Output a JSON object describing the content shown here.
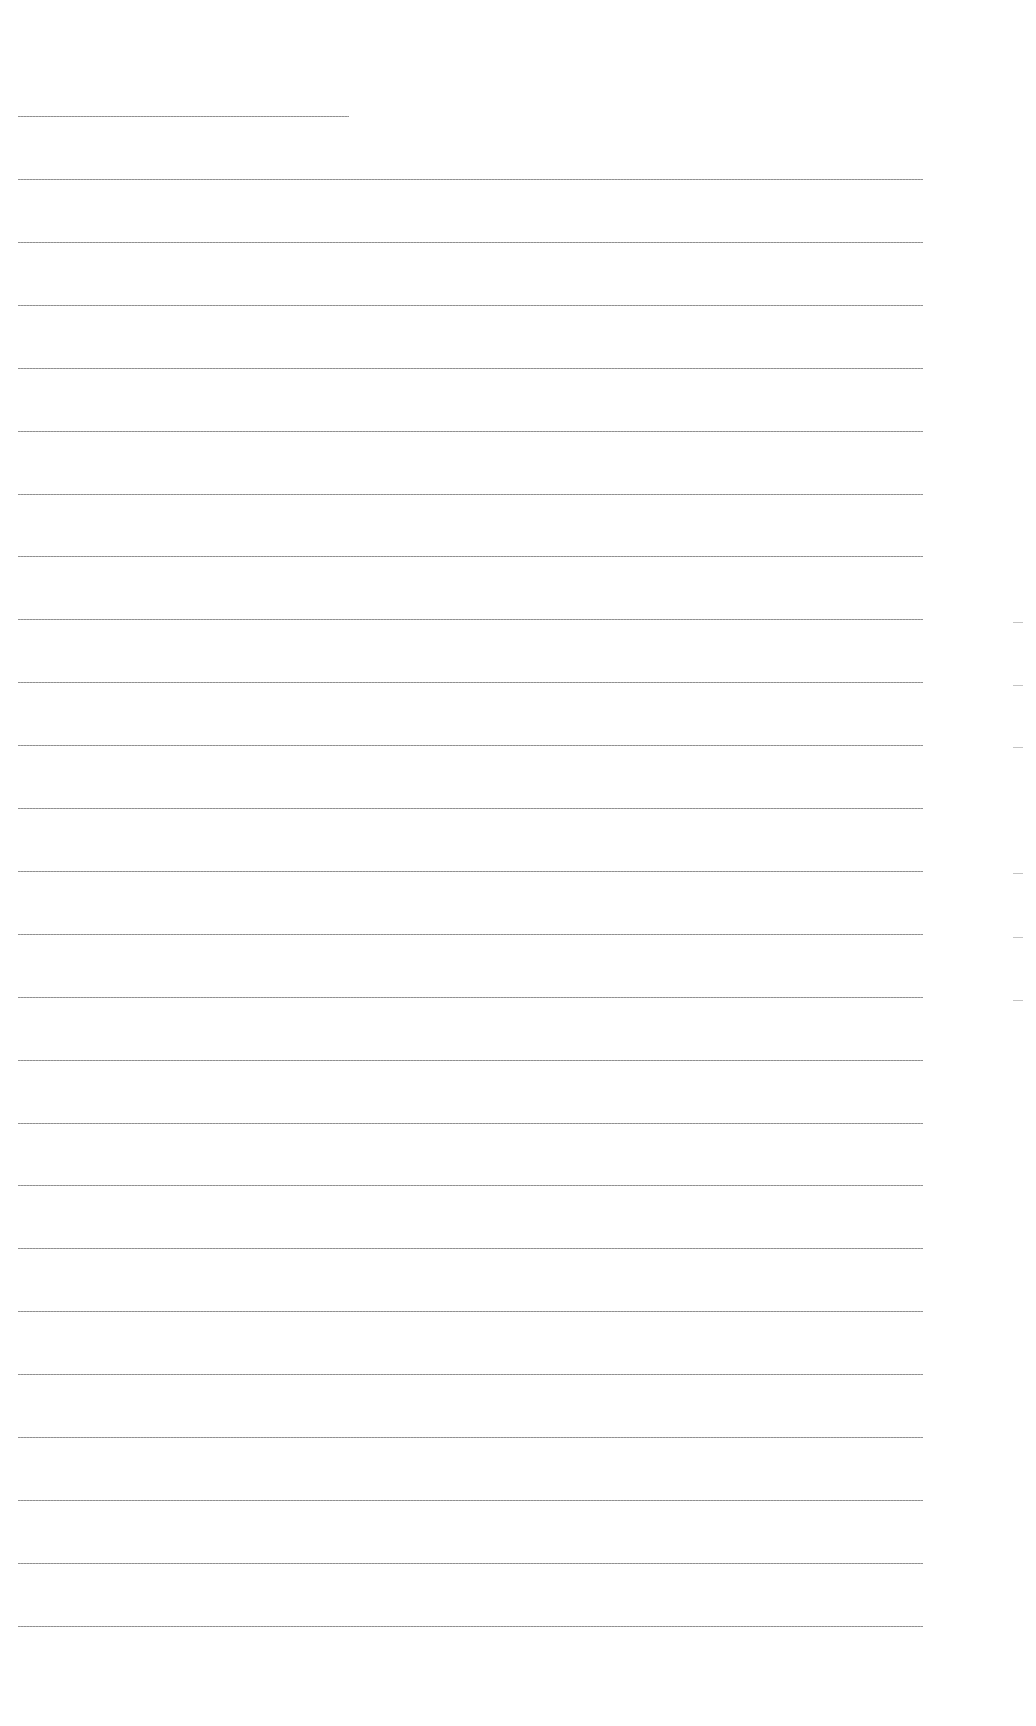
{
  "document": {
    "type": "blank lined paper",
    "background_color": "#ffffff",
    "line_color": "#888888",
    "header_line": {
      "x_start": 18,
      "x_end": 349,
      "y": 116
    },
    "ruled_lines": {
      "count": 24,
      "x_start": 18,
      "x_end": 923,
      "first_y": 179,
      "spacing": 62.9
    },
    "margin_ticks": {
      "x_start": 1013,
      "width": 10,
      "y_positions": [
        622,
        685,
        747,
        873,
        937,
        1000
      ]
    },
    "text_content": []
  }
}
